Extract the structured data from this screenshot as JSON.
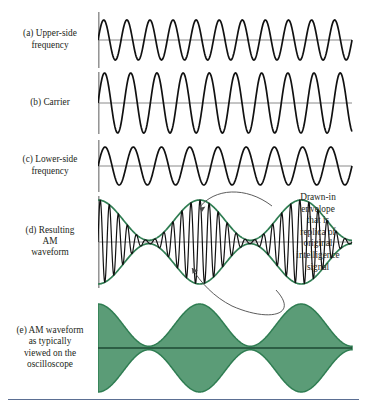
{
  "figure": {
    "colors": {
      "trace": "#111111",
      "envelope": "#2f7d52",
      "fill": "#5b9c77",
      "axis": "#8a8a8a",
      "zero_line": "#7d7d7d",
      "leader": "#4a4a4a",
      "bottom_rule": "#5b6f93"
    },
    "bottom_rule": true
  },
  "panels": [
    {
      "key": "upper-side-frequency",
      "lead": "(a) Upper-side",
      "lines": [
        "frequency"
      ],
      "waveform": "sine",
      "cycles": 11,
      "amplitude": 20,
      "top": 12,
      "height": 56,
      "axis": true
    },
    {
      "key": "carrier",
      "lead": "(b) Carrier",
      "lines": [],
      "waveform": "sine",
      "cycles": 9.7,
      "amplitude": 30,
      "top": 72,
      "height": 62,
      "axis": true
    },
    {
      "key": "lower-side-frequency",
      "lead": "(c) Lower-side",
      "lines": [
        "frequency"
      ],
      "waveform": "sine",
      "cycles": 9,
      "amplitude": 19,
      "top": 140,
      "height": 52,
      "axis": true
    },
    {
      "key": "resulting-am-waveform",
      "lead": "(d) Resulting",
      "lines": [
        "AM",
        "waveform"
      ],
      "waveform": "am-modulated",
      "cycles": 28,
      "envelope_cycles": 2.5,
      "amplitude": 42,
      "top": 196,
      "height": 92,
      "axis": true
    },
    {
      "key": "am-waveform-oscilloscope",
      "lead": "(e) AM waveform",
      "lines": [
        "as typically",
        "viewed on the",
        "oscilloscope"
      ],
      "waveform": "am-filled",
      "envelope_cycles": 2.5,
      "amplitude": 44,
      "top": 300,
      "height": 96,
      "axis": false
    }
  ],
  "annotation": {
    "key": "drawn-in-envelope-note",
    "lines": [
      "Drawn-in",
      "envelope",
      "that is",
      "replica of",
      "original",
      "intelligence",
      "signal"
    ]
  },
  "chart_data": {
    "type": "line",
    "xlabel": "",
    "ylabel": "",
    "series": [
      {
        "name": "Upper-side frequency",
        "waveform": "sine",
        "cycles": 11,
        "amplitude": 20
      },
      {
        "name": "Carrier",
        "waveform": "sine",
        "cycles": 9.7,
        "amplitude": 30
      },
      {
        "name": "Lower-side frequency",
        "waveform": "sine",
        "cycles": 9,
        "amplitude": 19
      },
      {
        "name": "Resulting AM waveform",
        "waveform": "am",
        "carrier_cycles": 28,
        "envelope_cycles": 2.5,
        "amplitude": 42
      },
      {
        "name": "AM waveform on oscilloscope",
        "waveform": "am-filled",
        "envelope_cycles": 2.5,
        "amplitude": 44
      }
    ]
  }
}
